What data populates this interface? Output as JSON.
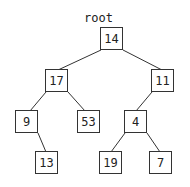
{
  "root_label": "root",
  "nodes": [
    {
      "id": "n14",
      "value": "14",
      "x": 100,
      "y": 27
    },
    {
      "id": "n17",
      "value": "17",
      "x": 45,
      "y": 69
    },
    {
      "id": "n11",
      "value": "11",
      "x": 151,
      "y": 69
    },
    {
      "id": "n9",
      "value": "9",
      "x": 15,
      "y": 110
    },
    {
      "id": "n53",
      "value": "53",
      "x": 77,
      "y": 110
    },
    {
      "id": "n4",
      "value": "4",
      "x": 124,
      "y": 110
    },
    {
      "id": "n13",
      "value": "13",
      "x": 35,
      "y": 151
    },
    {
      "id": "n19",
      "value": "19",
      "x": 99,
      "y": 151
    },
    {
      "id": "n7",
      "value": "7",
      "x": 149,
      "y": 151
    }
  ],
  "edges": [
    [
      "n14",
      "n17"
    ],
    [
      "n14",
      "n11"
    ],
    [
      "n17",
      "n9"
    ],
    [
      "n17",
      "n53"
    ],
    [
      "n11",
      "n4"
    ],
    [
      "n9",
      "n13"
    ],
    [
      "n4",
      "n19"
    ],
    [
      "n4",
      "n7"
    ]
  ],
  "colors": {
    "stroke": "#333333",
    "text": "#222222",
    "background": "#ffffff"
  }
}
